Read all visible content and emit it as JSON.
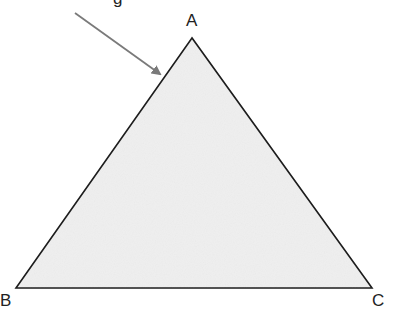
{
  "diagram": {
    "type": "triangle",
    "vertices": [
      {
        "label": "A",
        "x": 192,
        "y": 38
      },
      {
        "label": "B",
        "x": 16,
        "y": 288
      },
      {
        "label": "C",
        "x": 372,
        "y": 288
      }
    ],
    "fill_color": "#efefef",
    "stroke_color": "#1a1a1a",
    "arrow": {
      "from": [
        75,
        13
      ],
      "to": [
        161,
        75
      ],
      "color": "#7a7a7a",
      "points_to": "side AB near A"
    },
    "cropped_top_text": "g"
  }
}
